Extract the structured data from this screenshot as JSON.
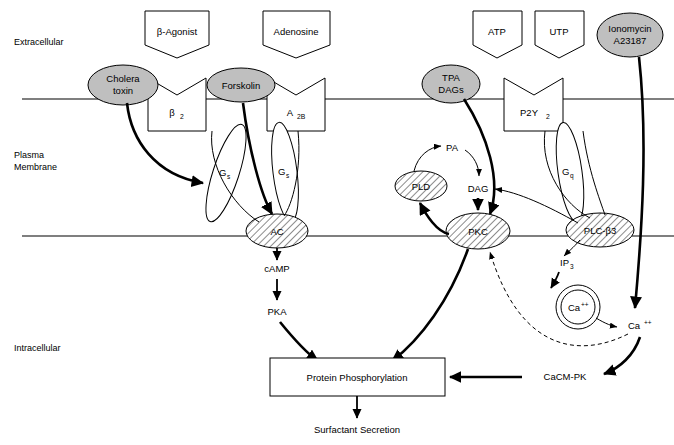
{
  "figure": {
    "zones": [
      {
        "id": "extracellular",
        "label": "Extracellular",
        "x": 14,
        "y": 42
      },
      {
        "id": "plasma-membrane",
        "label": "Plasma\nMembrane",
        "line1": "Plasma",
        "line2": "Membrane",
        "x": 14,
        "y": 158
      },
      {
        "id": "intracellular",
        "label": "Intracellular",
        "x": 14,
        "y": 348
      }
    ],
    "membranes": [
      {
        "id": "outer-membrane-line",
        "y": 99
      },
      {
        "id": "inner-membrane-line",
        "y": 236
      }
    ],
    "ligands": [
      {
        "id": "beta-agonist",
        "label": "β-Agonist",
        "cx": 177,
        "cy": 31
      },
      {
        "id": "adenosine",
        "label": "Adenosine",
        "cx": 296,
        "cy": 31
      },
      {
        "id": "atp",
        "label": "ATP",
        "cx": 497,
        "cy": 31
      },
      {
        "id": "utp",
        "label": "UTP",
        "cx": 559,
        "cy": 31
      }
    ],
    "drugs": [
      {
        "id": "cholera-toxin",
        "line1": "Cholera",
        "line2": "toxin",
        "cx": 123,
        "cy": 85
      },
      {
        "id": "forskolin",
        "line1": "Forskolin",
        "line2": "",
        "cx": 241,
        "cy": 85
      },
      {
        "id": "tpa-dags",
        "line1": "TPA",
        "line2": "DAGs",
        "cx": 451,
        "cy": 84
      },
      {
        "id": "ionomycin",
        "line1": "Ionomycin",
        "line2": "A23187",
        "cx": 630,
        "cy": 35
      }
    ],
    "receptors": [
      {
        "id": "beta2-receptor",
        "label": "β",
        "sub": "2",
        "cx": 177,
        "cy": 107
      },
      {
        "id": "a2b-receptor",
        "label": "A",
        "sub": "2B",
        "cx": 296,
        "cy": 107
      },
      {
        "id": "p2y2-receptor",
        "label": "P2Y",
        "sub": "2",
        "cx": 534,
        "cy": 107
      }
    ],
    "gproteins": [
      {
        "id": "gs-beta2",
        "label": "G",
        "sub": "s",
        "cx": 222,
        "cy": 173
      },
      {
        "id": "gs-a2b",
        "label": "G",
        "sub": "s",
        "cx": 281,
        "cy": 172
      },
      {
        "id": "gq-p2y2",
        "label": "G",
        "sub": "q",
        "cx": 565,
        "cy": 172
      }
    ],
    "effectors": [
      {
        "id": "adenylyl-cyclase",
        "label": "AC",
        "cx": 277,
        "cy": 231
      },
      {
        "id": "pkc",
        "label": "PKC",
        "cx": 478,
        "cy": 231
      },
      {
        "id": "plc-beta3",
        "label": "PLC-β3",
        "cx": 600,
        "cy": 230
      },
      {
        "id": "pld",
        "label": "PLD",
        "cx": 421,
        "cy": 186
      }
    ],
    "messengers": [
      {
        "id": "camp",
        "label": "cAMP",
        "cx": 277,
        "cy": 269
      },
      {
        "id": "pka",
        "label": "PKA",
        "cx": 277,
        "cy": 311
      },
      {
        "id": "pa",
        "label": "PA",
        "cx": 452,
        "cy": 148
      },
      {
        "id": "dag",
        "label": "DAG",
        "cx": 478,
        "cy": 188
      },
      {
        "id": "ip3",
        "label": "IP",
        "sub": "3",
        "cx": 567,
        "cy": 263
      },
      {
        "id": "calcium-store",
        "label": "Ca",
        "sup": "++",
        "cx": 578,
        "cy": 307
      },
      {
        "id": "calcium-cytosolic",
        "label": "Ca",
        "sup": "++",
        "cx": 638,
        "cy": 325
      },
      {
        "id": "cacm-pk",
        "label": "CaCM-PK",
        "cx": 565,
        "cy": 377
      }
    ],
    "outputs": [
      {
        "id": "protein-phosphorylation",
        "label": "Protein Phosphorylation",
        "cx": 355,
        "cy": 377
      },
      {
        "id": "surfactant-secretion",
        "label": "Surfactant Secretion",
        "cx": 355,
        "cy": 430
      }
    ],
    "colors": {
      "drug_fill": "#bfbfbf",
      "membrane_stroke": "#555555",
      "stroke": "#000000",
      "background": "#ffffff"
    }
  }
}
